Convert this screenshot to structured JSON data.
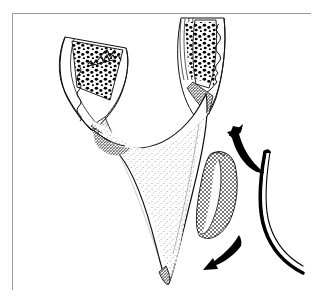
{
  "page": {
    "background_color": "#ffffff",
    "width_px": 324,
    "height_px": 305,
    "top_caption_text": "",
    "frame": {
      "border_color": "#9a9a9a",
      "fill_color": "#ffffff",
      "left_px": 12,
      "top_px": 13,
      "width_px": 299,
      "height_px": 277
    }
  },
  "figure": {
    "name": "dental-extraction-illustration",
    "style": "black-and-white pen-and-ink stipple line drawing",
    "ink_color": "#000000",
    "annotation_scribble": "",
    "parts": [
      {
        "id": "left-tooth-root",
        "label": "left tooth root in alveolar bone",
        "description": "tapered root sloping down-left with stippled pulp chamber and wavy periodontal ligament line"
      },
      {
        "id": "right-tooth-root",
        "label": "right tooth root in alveolar bone",
        "description": "vertical root with stippled pulp chamber and wavy periodontal ligament line"
      },
      {
        "id": "interdental-bone-septum",
        "label": "interdental bone septum",
        "description": "large central stippled bone wedge tapering to a point at the bottom"
      },
      {
        "id": "bone-fragment",
        "label": "mobilised bone fragment",
        "description": "cross-hatched shaded fragment lateral to the septum",
        "shading": "crosshatch"
      },
      {
        "id": "arrow-up",
        "label": "upward force arrow",
        "direction": "up-left",
        "description": "solid tapered curved arrow pointing superiorly"
      },
      {
        "id": "arrow-down",
        "label": "downward force arrow",
        "direction": "down-left",
        "description": "solid tapered curved arrow pointing inferiorly"
      },
      {
        "id": "elevator-instrument",
        "label": "dental elevator instrument",
        "description": "long slender curved instrument shaft entering from the lower right"
      }
    ]
  }
}
